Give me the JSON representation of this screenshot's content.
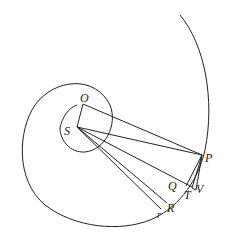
{
  "diagram": {
    "type": "geometric-spiral-orbit",
    "stroke_color": "#222222",
    "background": "#ffffff",
    "points": {
      "O": {
        "label": "O",
        "x": 83,
        "y": 104
      },
      "S": {
        "label": "S",
        "x": 77,
        "y": 127
      },
      "P": {
        "label": "P",
        "x": 202,
        "y": 155
      },
      "Q": {
        "label": "Q",
        "x": 186,
        "y": 185
      },
      "T": {
        "label": "T",
        "x": 192,
        "y": 187
      },
      "V": {
        "label": "V",
        "x": 196,
        "y": 189
      },
      "R": {
        "label": "R",
        "x": 167,
        "y": 202
      },
      "r": {
        "label": "r",
        "x": 161,
        "y": 207
      }
    },
    "labels": [
      "O",
      "S",
      "P",
      "Q",
      "T",
      "V",
      "R",
      "r"
    ]
  }
}
